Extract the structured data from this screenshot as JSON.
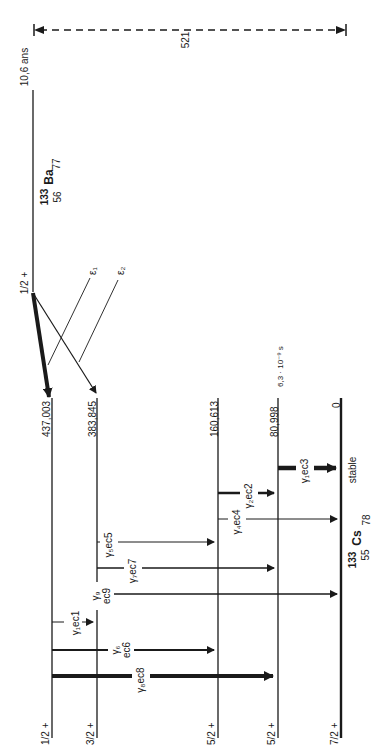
{
  "q_value": {
    "label": "521"
  },
  "parent": {
    "mass": "133",
    "symbol": "Ba",
    "z": "56",
    "n": "77",
    "half_life": "10,6 ans",
    "spin": "1/2 +"
  },
  "daughter": {
    "mass": "133",
    "symbol": "Cs",
    "z": "55",
    "n": "78",
    "status": "stable"
  },
  "levels": [
    {
      "energy": "437,003",
      "spin": "1/2 +"
    },
    {
      "energy": "383,845",
      "spin": "3/2 +"
    },
    {
      "energy": "160,613",
      "spin": "5/2 +"
    },
    {
      "energy": "80,998",
      "spin": "5/2 +",
      "half_life": "6,3 · 10⁻⁹ s"
    },
    {
      "energy": "0",
      "spin": "7/2 +"
    }
  ],
  "ec_branches": [
    {
      "label": "ε₁",
      "to": "383,845"
    },
    {
      "label": "ε₂",
      "to": "437,003"
    }
  ],
  "transitions": [
    {
      "label": "γ₁ec1",
      "from": "437,003",
      "to": "383,845"
    },
    {
      "label": "γ₆ ec6",
      "from": "437,003",
      "to": "160,613"
    },
    {
      "label": "γ₈ec8",
      "from": "437,003",
      "to": "80,998"
    },
    {
      "label": "γ₅ec5",
      "from": "383,845",
      "to": "160,613"
    },
    {
      "label": "γ₇ec7",
      "from": "383,845",
      "to": "80,998"
    },
    {
      "label": "γ₉ ec9",
      "from": "383,845",
      "to": "0"
    },
    {
      "label": "γ₂ec2",
      "from": "160,613",
      "to": "80,998"
    },
    {
      "label": "γ₄ec4",
      "from": "160,613",
      "to": "0"
    },
    {
      "label": "γ₃ec3",
      "from": "80,998",
      "to": "0"
    }
  ],
  "labels": {
    "q": "521",
    "half_life": "10,6 ans",
    "parent_spin": "1/2 +",
    "parent_mass": "133",
    "parent_sym": "Ba",
    "parent_z": "56",
    "parent_n": "77",
    "daughter_mass": "133",
    "daughter_sym": "Cs",
    "daughter_z": "55",
    "daughter_n": "78",
    "stable": "stable",
    "eps1": "ε₁",
    "eps2": "ε₂",
    "e0": "437,003",
    "e1": "383,845",
    "e2": "160,613",
    "e3": "80,998",
    "e4": "0",
    "t3": "6,3 · 10⁻⁹ s",
    "s0": "1/2 +",
    "s1": "3/2 +",
    "s2": "5/2 +",
    "s3": "5/2 +",
    "s4": "7/2 +",
    "g1": "γ₁ec1",
    "g6a": "γ₆",
    "g6b": "ec6",
    "g8": "γ₈ec8",
    "g5": "γ₅ec5",
    "g7": "γ₇ec7",
    "g9a": "γ₉",
    "g9b": "ec9",
    "g2": "γ₂ec2",
    "g4": "γ₄ec4",
    "g3": "γ₁ec3"
  }
}
